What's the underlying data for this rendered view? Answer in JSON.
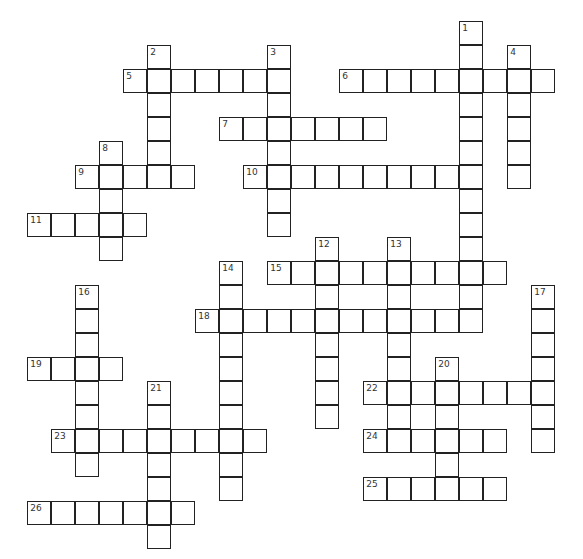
{
  "puzzle": {
    "grid": {
      "origin_x": 28,
      "origin_y": 22,
      "cell_size": 24,
      "border_color": "#222222",
      "cell_fill": "#ffffff"
    },
    "entries": [
      {
        "number": "1",
        "direction": "down",
        "row": 0,
        "col": 18,
        "length": 13
      },
      {
        "number": "2",
        "direction": "down",
        "row": 1,
        "col": 5,
        "length": 6
      },
      {
        "number": "3",
        "direction": "down",
        "row": 1,
        "col": 10,
        "length": 8
      },
      {
        "number": "4",
        "direction": "down",
        "row": 1,
        "col": 20,
        "length": 6
      },
      {
        "number": "5",
        "direction": "across",
        "row": 2,
        "col": 4,
        "length": 7
      },
      {
        "number": "6",
        "direction": "across",
        "row": 2,
        "col": 13,
        "length": 9
      },
      {
        "number": "7",
        "direction": "across",
        "row": 4,
        "col": 8,
        "length": 7
      },
      {
        "number": "8",
        "direction": "down",
        "row": 5,
        "col": 3,
        "length": 5
      },
      {
        "number": "9",
        "direction": "across",
        "row": 6,
        "col": 2,
        "length": 5
      },
      {
        "number": "10",
        "direction": "across",
        "row": 6,
        "col": 9,
        "length": 10
      },
      {
        "number": "11",
        "direction": "across",
        "row": 8,
        "col": 0,
        "length": 5
      },
      {
        "number": "12",
        "direction": "down",
        "row": 9,
        "col": 12,
        "length": 8
      },
      {
        "number": "13",
        "direction": "down",
        "row": 9,
        "col": 15,
        "length": 9
      },
      {
        "number": "14",
        "direction": "down",
        "row": 10,
        "col": 8,
        "length": 10
      },
      {
        "number": "15",
        "direction": "across",
        "row": 10,
        "col": 10,
        "length": 10
      },
      {
        "number": "16",
        "direction": "down",
        "row": 11,
        "col": 2,
        "length": 8
      },
      {
        "number": "17",
        "direction": "down",
        "row": 11,
        "col": 21,
        "length": 7
      },
      {
        "number": "18",
        "direction": "across",
        "row": 12,
        "col": 7,
        "length": 12
      },
      {
        "number": "19",
        "direction": "across",
        "row": 14,
        "col": 0,
        "length": 4
      },
      {
        "number": "20",
        "direction": "down",
        "row": 14,
        "col": 17,
        "length": 6
      },
      {
        "number": "21",
        "direction": "down",
        "row": 15,
        "col": 5,
        "length": 7
      },
      {
        "number": "22",
        "direction": "across",
        "row": 15,
        "col": 14,
        "length": 8
      },
      {
        "number": "23",
        "direction": "across",
        "row": 17,
        "col": 1,
        "length": 9
      },
      {
        "number": "24",
        "direction": "across",
        "row": 17,
        "col": 14,
        "length": 6
      },
      {
        "number": "25",
        "direction": "across",
        "row": 19,
        "col": 14,
        "length": 6
      },
      {
        "number": "26",
        "direction": "across",
        "row": 20,
        "col": 0,
        "length": 7
      }
    ]
  }
}
